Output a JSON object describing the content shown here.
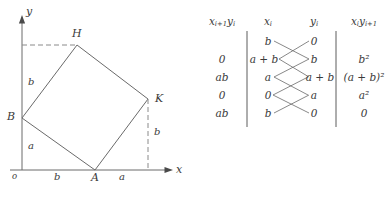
{
  "figure": {
    "caption": ""
  },
  "diagram": {
    "axis": {
      "x_label": "x",
      "y_label": "y",
      "origin_label": "o"
    },
    "vertices": [
      {
        "name": "H",
        "label": "H"
      },
      {
        "name": "K",
        "label": "K"
      },
      {
        "name": "A",
        "label": "A"
      },
      {
        "name": "B",
        "label": "B"
      }
    ],
    "segment_labels": [
      {
        "name": "y-axis-upper-b",
        "label": "b"
      },
      {
        "name": "y-axis-lower-a",
        "label": "a"
      },
      {
        "name": "x-axis-left-b",
        "label": "b"
      },
      {
        "name": "x-axis-right-a",
        "label": "a"
      },
      {
        "name": "right-drop-b",
        "label": "b"
      }
    ],
    "stroke_color": "#6a6a6a",
    "dash_color": "#8a8a8a"
  },
  "table": {
    "headers": [
      {
        "name": "col-xi1yi",
        "base1": "x",
        "sub1": "i+1",
        "base2": "y",
        "sub2": "i"
      },
      {
        "name": "col-xi",
        "base1": "x",
        "sub1": "i",
        "base2": "",
        "sub2": ""
      },
      {
        "name": "col-yi",
        "base1": "y",
        "sub1": "i",
        "base2": "",
        "sub2": ""
      },
      {
        "name": "col-xiyi1",
        "base1": "x",
        "sub1": "i",
        "base2": "y",
        "sub2": "i+1"
      }
    ],
    "header_text": {
      "c1": "xᵢ₊₁yᵢ",
      "c2": "xᵢ",
      "c3": "yᵢ",
      "c4": "xᵢyᵢ₊₁"
    },
    "rows": [
      {
        "left": "",
        "xi": "b",
        "yi": "0",
        "right": ""
      },
      {
        "left": "0",
        "xi": "a + b",
        "yi": "b",
        "right": "b²"
      },
      {
        "left": "ab",
        "xi": "a",
        "yi": "a + b",
        "right": "(a + b)²"
      },
      {
        "left": "0",
        "xi": "0",
        "yi": "a",
        "right": "a²"
      },
      {
        "left": "ab",
        "xi": "b",
        "yi": "0",
        "right": "0"
      }
    ],
    "rule_color": "#4a4a4a",
    "cross_line_color": "#6a6a6a"
  }
}
